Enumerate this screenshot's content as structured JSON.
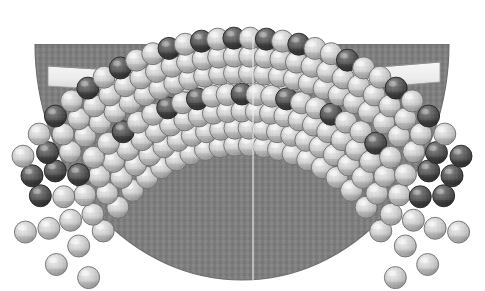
{
  "figure": {
    "description": "Grayscale scientific schematic: a textured gray hemispherical bulk core capped by curved close-packed rows of light and dark spheres, separated by a pale slab band.",
    "background_color": "#ffffff",
    "width": 485,
    "height": 291
  },
  "colors": {
    "background": "#ffffff",
    "bulk_core": "#848484",
    "bulk_core_shade": "#787878",
    "bulk_core_texture": "#8d8d8d",
    "bulk_outline": "#6f6f6f",
    "slab_band": "#efefef",
    "slab_band_shadow": "#d6d6d6",
    "slab_band_outline": "#9a9a9a",
    "sphere_light": "#c9c9c9",
    "sphere_light_high": "#ededed",
    "sphere_light_low": "#8e8e8e",
    "sphere_dark": "#575757",
    "sphere_dark_high": "#9a9a9a",
    "sphere_dark_low": "#2b2b2b",
    "sphere_outline": "#5a5a5a",
    "center_line": "#f2f2f2",
    "ghost_artifact": "#f0f0f0"
  },
  "geometry": {
    "dome": {
      "center_x": 242,
      "center_y": 44,
      "radius_x": 207,
      "radius_y": 236,
      "bottom_y": 280,
      "left_x": 35,
      "right_x": 449
    },
    "center_line": {
      "x": 253,
      "y_top": 36,
      "y_bottom": 280,
      "width": 1
    },
    "slab": {
      "left_x": 48,
      "right_x": 440,
      "top_y": 62,
      "bottom_y": 82,
      "sag": 10
    }
  },
  "layers": [
    {
      "name": "top-surface-row",
      "index": 0,
      "sphere_radius": 11,
      "arc_center_y": 300,
      "arc_radius": 262,
      "count": 28,
      "dark_positions": [
        2,
        4,
        6,
        9,
        11,
        13,
        15,
        17,
        20,
        23,
        25,
        27
      ]
    },
    {
      "name": "second-row",
      "index": 1,
      "sphere_radius": 11,
      "arc_center_y": 300,
      "arc_radius": 244,
      "count": 29,
      "dark_positions": [
        0,
        1,
        26,
        27,
        28
      ]
    },
    {
      "name": "slab-top-row",
      "index": 2,
      "sphere_radius": 11,
      "arc_center_y": 300,
      "arc_radius": 227,
      "count": 30,
      "dark_positions": [
        1,
        2,
        27,
        28
      ]
    },
    {
      "name": "slab-bottom-row",
      "index": 3,
      "sphere_radius": 11,
      "arc_center_y": 300,
      "arc_radius": 206,
      "count": 30,
      "dark_positions": [
        3,
        6,
        9,
        11,
        14,
        17,
        20,
        23,
        26
      ]
    },
    {
      "name": "sublayer-row-a",
      "index": 4,
      "sphere_radius": 11,
      "arc_center_y": 300,
      "arc_radius": 189,
      "count": 31,
      "dark_positions": []
    },
    {
      "name": "sublayer-row-b",
      "index": 5,
      "sphere_radius": 11,
      "arc_center_y": 300,
      "arc_radius": 172,
      "count": 31,
      "dark_positions": []
    },
    {
      "name": "sublayer-row-c",
      "index": 6,
      "sphere_radius": 11,
      "arc_center_y": 300,
      "arc_radius": 155,
      "count": 30,
      "dark_positions": []
    }
  ],
  "artifacts": [
    {
      "name": "ghost-shape-left",
      "x": 42,
      "y": -6,
      "width": 22,
      "height": 16
    },
    {
      "name": "ghost-shape-right",
      "x": 72,
      "y": -8,
      "width": 26,
      "height": 18
    }
  ],
  "legend": {
    "visible": false,
    "items": []
  }
}
